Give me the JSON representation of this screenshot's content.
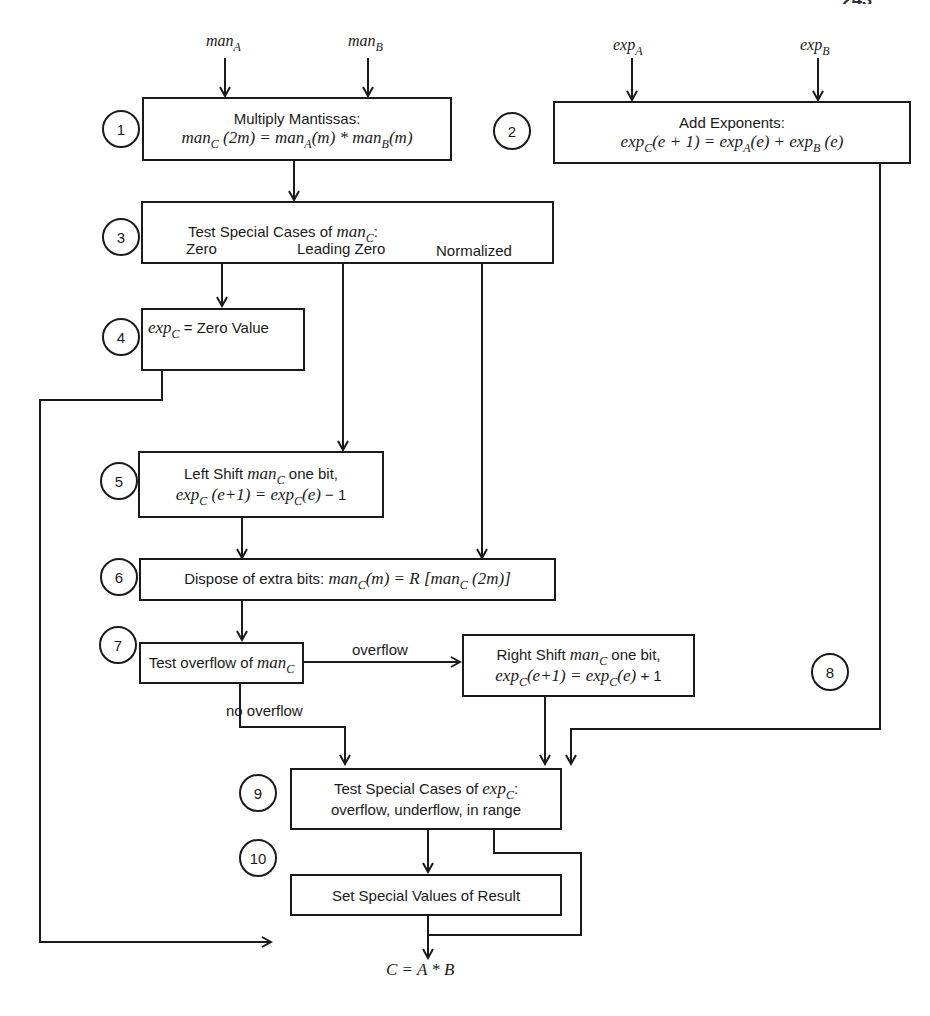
{
  "page_header": {
    "running_title_clipped": "",
    "page_number_clipped": "243"
  },
  "inputs": {
    "man_a": {
      "base": "man",
      "sub": "A"
    },
    "man_b": {
      "base": "man",
      "sub": "B"
    },
    "exp_a": {
      "base": "exp",
      "sub": "A"
    },
    "exp_b": {
      "base": "exp",
      "sub": "B"
    }
  },
  "steps": [
    {
      "num": "1",
      "title": "Multiply Mantissas:",
      "formula": "man_C (2m) = man_A(m) * man_B(m)"
    },
    {
      "num": "2",
      "title": "Add Exponents:",
      "formula": "exp_C(e + 1) = exp_A(e) + exp_B (e)"
    },
    {
      "num": "3",
      "title": "Test Special Cases of man_C:",
      "cases": [
        "Zero",
        "Leading Zero",
        "Normalized"
      ]
    },
    {
      "num": "4",
      "formula": "exp_C = Zero Value"
    },
    {
      "num": "5",
      "title": "Left Shift man_C one bit,",
      "formula": "exp_C (e+1) = exp_C(e) − 1"
    },
    {
      "num": "6",
      "title": "Dispose of extra bits:",
      "formula": "man_C(m) = R [man_C(2m)]"
    },
    {
      "num": "7",
      "title": "Test overflow of man_C"
    },
    {
      "num": "8",
      "title": "Right Shift man_C one bit,",
      "formula": "exp_C(e+1) = exp_C(e) + 1"
    },
    {
      "num": "9",
      "title": "Test Special Cases of exp_C:",
      "subtitle": "overflow, underflow, in range"
    },
    {
      "num": "10",
      "title": "Set Special Values of Result"
    }
  ],
  "text": {
    "s1_title": "Multiply Mantissas:",
    "s2_title": "Add Exponents:",
    "s3_title_pre": "Test Special Cases of ",
    "s3_case_zero": "Zero",
    "s3_case_leading": "Leading Zero",
    "s3_case_norm": "Normalized",
    "s4_rest": " = Zero Value",
    "s5_title_pre": "Left Shift ",
    "s5_title_post": " one bit,",
    "s5_minus": " − 1",
    "s6_title": "Dispose of extra bits:  ",
    "s7_title_pre": "Test overflow of ",
    "s8_title_pre": "Right Shift ",
    "s8_title_post": " one bit,",
    "s8_plus": " + 1",
    "s9_title_pre": "Test Special Cases of ",
    "s9_subtitle": "overflow, underflow, in range",
    "s10_title": "Set Special Values of Result",
    "edge_overflow": "overflow",
    "edge_no_overflow": "no overflow",
    "output_formula": "C = A * B",
    "man": "man",
    "exp": "exp",
    "C": "C",
    "A": "A",
    "B": "B",
    "arg_2m": " (2m)",
    "arg_m": "(m)",
    "times": " * ",
    "eq": " = ",
    "arg_e1": "(e + 1)",
    "arg_e": "(e)",
    "arg_e_sp": " (e)",
    "plus": " + ",
    "arg_e1_tight": " (e+1)",
    "arg_e1_nosp": "(e+1)",
    "R": "R",
    "lbr": " [",
    "rbr": "]",
    "colon": ":"
  },
  "colors": {
    "ink": "#1a1a1a",
    "paper": "#ffffff"
  }
}
